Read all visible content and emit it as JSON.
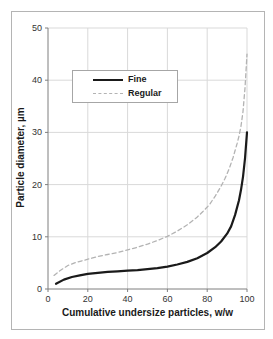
{
  "figure": {
    "background": "#ffffff",
    "border_color": "#b4b4b4"
  },
  "chart_data": {
    "type": "line",
    "title": "",
    "xlabel": "Cumulative undersize particles, w/w",
    "ylabel": "Particle diameter, µm",
    "xlim": [
      0,
      100
    ],
    "ylim": [
      0,
      50
    ],
    "x_ticks": [
      0,
      20,
      40,
      60,
      80,
      100
    ],
    "y_ticks": [
      0,
      10,
      20,
      30,
      40,
      50
    ],
    "grid": true,
    "legend_position": "upper-left-inside",
    "colors": {
      "grid": "#d9d9d9",
      "axis": "#7f7f7f",
      "tick_text": "#333333",
      "legend_border": "#a6a6a6"
    },
    "series": [
      {
        "name": "Fine",
        "color": "#1a1a1a",
        "style": "solid",
        "width": 2.2,
        "dash": null,
        "points": [
          [
            4,
            1.0
          ],
          [
            8,
            1.8
          ],
          [
            12,
            2.3
          ],
          [
            16,
            2.6
          ],
          [
            20,
            2.9
          ],
          [
            25,
            3.1
          ],
          [
            30,
            3.3
          ],
          [
            35,
            3.4
          ],
          [
            40,
            3.5
          ],
          [
            45,
            3.6
          ],
          [
            50,
            3.8
          ],
          [
            55,
            4.0
          ],
          [
            60,
            4.3
          ],
          [
            65,
            4.7
          ],
          [
            70,
            5.2
          ],
          [
            75,
            5.9
          ],
          [
            80,
            6.9
          ],
          [
            84,
            8.0
          ],
          [
            87,
            9.1
          ],
          [
            90,
            10.6
          ],
          [
            92,
            12.0
          ],
          [
            94,
            14.2
          ],
          [
            96,
            17.0
          ],
          [
            97,
            19.0
          ],
          [
            98,
            21.5
          ],
          [
            99,
            25.0
          ],
          [
            100,
            30.0
          ]
        ]
      },
      {
        "name": "Regular",
        "color": "#b3b3b3",
        "style": "dashed",
        "width": 1.3,
        "dash": [
          4,
          3
        ],
        "points": [
          [
            3,
            2.6
          ],
          [
            6,
            3.5
          ],
          [
            10,
            4.5
          ],
          [
            14,
            5.1
          ],
          [
            18,
            5.5
          ],
          [
            22,
            5.9
          ],
          [
            26,
            6.3
          ],
          [
            30,
            6.6
          ],
          [
            35,
            7.0
          ],
          [
            40,
            7.5
          ],
          [
            45,
            8.0
          ],
          [
            50,
            8.6
          ],
          [
            55,
            9.3
          ],
          [
            60,
            10.1
          ],
          [
            65,
            11.1
          ],
          [
            70,
            12.3
          ],
          [
            75,
            13.8
          ],
          [
            78,
            14.9
          ],
          [
            81,
            16.1
          ],
          [
            84,
            17.8
          ],
          [
            87,
            19.7
          ],
          [
            89,
            21.2
          ],
          [
            91,
            23.0
          ],
          [
            93,
            25.2
          ],
          [
            95,
            27.8
          ],
          [
            96,
            29.3
          ],
          [
            97,
            31.2
          ],
          [
            98,
            34.0
          ],
          [
            99,
            38.5
          ],
          [
            100,
            45.0
          ]
        ]
      }
    ]
  }
}
